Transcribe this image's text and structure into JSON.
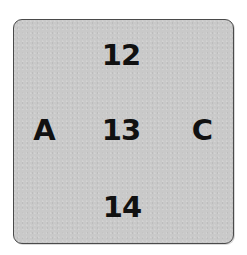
{
  "figure": {
    "background_color": "#c9c9c9",
    "border_color": "#4a4a4a",
    "text_color": "#111111",
    "vertical_sequence": {
      "top": "12",
      "middle": "13",
      "bottom": "14"
    },
    "horizontal_sequence": {
      "left": "A",
      "middle": "13",
      "right": "C"
    }
  }
}
